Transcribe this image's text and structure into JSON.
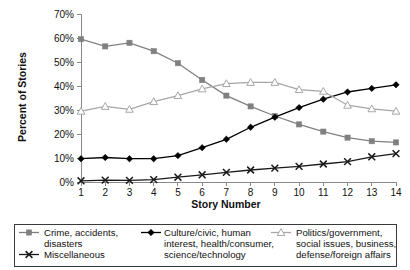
{
  "chart_data": {
    "type": "line",
    "title": "",
    "xlabel": "Story Number",
    "ylabel": "Percent of Stories",
    "x": [
      1,
      2,
      3,
      4,
      5,
      6,
      7,
      8,
      9,
      10,
      11,
      12,
      13,
      14
    ],
    "categories": [
      "1",
      "2",
      "3",
      "4",
      "5",
      "6",
      "7",
      "8",
      "9",
      "10",
      "11",
      "12",
      "13",
      "14"
    ],
    "xlim": [
      1,
      14
    ],
    "ylim": [
      0,
      70
    ],
    "yticks": [
      0,
      10,
      20,
      30,
      40,
      50,
      60,
      70
    ],
    "ytick_labels": [
      "0%",
      "10%",
      "20%",
      "30%",
      "40%",
      "50%",
      "60%",
      "70%"
    ],
    "grid": false,
    "legend_position": "bottom",
    "series": [
      {
        "name": "Crime, accidents, disasters",
        "marker": "square",
        "color": "#808080",
        "values": [
          59.5,
          56.5,
          58.0,
          54.5,
          49.5,
          42.5,
          36.0,
          31.5,
          27.5,
          24.0,
          21.0,
          18.5,
          17.0,
          16.5
        ]
      },
      {
        "name": "Culture/civic, human interest, health/consumer, science/technology",
        "marker": "diamond",
        "color": "#000000",
        "values": [
          9.7,
          10.2,
          9.7,
          9.7,
          11.0,
          14.3,
          17.8,
          22.8,
          27.0,
          31.0,
          34.5,
          37.5,
          39.0,
          40.5
        ]
      },
      {
        "name": "Politics/government, social issues, business, defense/foreign affairs",
        "marker": "triangle",
        "color": "#a6a6a6",
        "values": [
          29.5,
          31.5,
          30.3,
          33.5,
          36.0,
          38.8,
          41.0,
          41.5,
          41.5,
          38.5,
          37.8,
          32.0,
          30.5,
          29.5
        ]
      },
      {
        "name": "Miscellaneous",
        "marker": "cross",
        "color": "#1a1a1a",
        "values": [
          0.5,
          0.8,
          0.7,
          1.0,
          2.0,
          3.0,
          4.0,
          5.0,
          5.8,
          6.5,
          7.5,
          8.5,
          10.5,
          11.8
        ]
      }
    ]
  },
  "legend": {
    "entries": [
      {
        "marker": "square",
        "color": "#808080",
        "lines": [
          "Crime, accidents,",
          "disasters"
        ]
      },
      {
        "marker": "cross",
        "color": "#1a1a1a",
        "lines": [
          "Miscellaneous"
        ]
      },
      {
        "marker": "diamond",
        "color": "#000000",
        "lines": [
          "Culture/civic, human",
          "interest, health/consumer,",
          "science/technology"
        ]
      },
      {
        "marker": "triangle",
        "color": "#a6a6a6",
        "lines": [
          "Politics/government,",
          "social issues, business,",
          "defense/foreign affairs"
        ]
      }
    ]
  }
}
